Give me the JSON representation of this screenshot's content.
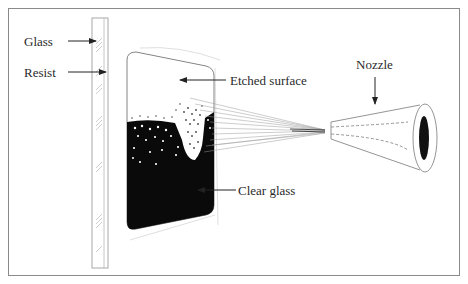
{
  "labels": {
    "glass": "Glass",
    "resist": "Resist",
    "etched_surface": "Etched surface",
    "clear_glass": "Clear glass",
    "nozzle": "Nozzle"
  },
  "colors": {
    "frame": "#8a8a8a",
    "ink": "#111111",
    "thin_line": "#b0b0b0",
    "text": "#2a2a2a"
  }
}
